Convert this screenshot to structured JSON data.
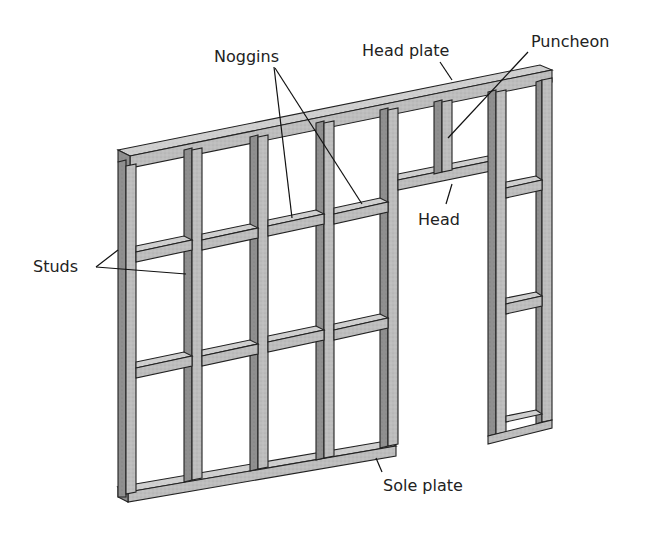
{
  "diagram": {
    "colors": {
      "timber_face": "#b9b9b9",
      "timber_side": "#8c8c8c",
      "timber_top": "#d2d2d2",
      "outline": "#222222",
      "label_text": "#222222",
      "background": "#ffffff"
    },
    "labels": {
      "head_plate": "Head plate",
      "puncheon": "Puncheon",
      "noggins": "Noggins",
      "head": "Head",
      "studs": "Studs",
      "sole_plate": "Sole plate"
    },
    "components": [
      "Head plate",
      "Sole plate",
      "Studs",
      "Noggins",
      "Head",
      "Puncheon",
      "Door opening"
    ]
  }
}
